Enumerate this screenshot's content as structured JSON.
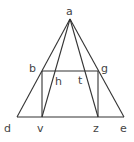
{
  "diagram": {
    "title": "",
    "points": {
      "a": {
        "x": 70,
        "y": 19
      },
      "b": {
        "x": 42,
        "y": 71
      },
      "g": {
        "x": 98,
        "y": 71
      },
      "d": {
        "x": 17,
        "y": 117
      },
      "e": {
        "x": 124,
        "y": 117
      },
      "v": {
        "x": 42,
        "y": 117
      },
      "z": {
        "x": 98,
        "y": 117
      },
      "h": {
        "x": 54,
        "y": 71
      },
      "t": {
        "x": 86,
        "y": 71
      }
    },
    "labels": {
      "a": "a",
      "b": "b",
      "g": "g",
      "h": "h",
      "t": "t",
      "d": "d",
      "v": "v",
      "z": "z",
      "e": "e"
    },
    "segments": [
      [
        "a",
        "d"
      ],
      [
        "a",
        "e"
      ],
      [
        "d",
        "e"
      ],
      [
        "b",
        "g"
      ],
      [
        "b",
        "v"
      ],
      [
        "g",
        "z"
      ],
      [
        "a",
        "v"
      ],
      [
        "a",
        "z"
      ]
    ]
  }
}
